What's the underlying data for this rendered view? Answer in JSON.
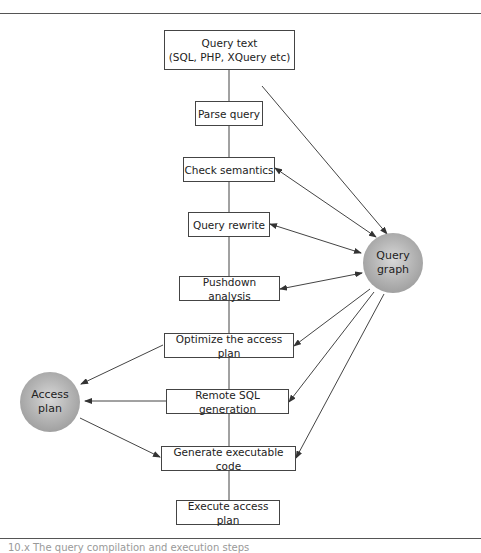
{
  "diagram": {
    "boxes": [
      {
        "id": "query-text",
        "label": "Query text\n(SQL, PHP, XQuery etc)",
        "line1": "Query text",
        "line2": "(SQL, PHP, XQuery etc)"
      },
      {
        "id": "parse-query",
        "label": "Parse query"
      },
      {
        "id": "check-semantics",
        "label": "Check semantics"
      },
      {
        "id": "query-rewrite",
        "label": "Query rewrite"
      },
      {
        "id": "pushdown-analysis",
        "label": "Pushdown analysis"
      },
      {
        "id": "optimize-access-plan",
        "label": "Optimize the access plan"
      },
      {
        "id": "remote-sql-generation",
        "label": "Remote SQL generation"
      },
      {
        "id": "generate-executable-code",
        "label": "Generate executable code"
      },
      {
        "id": "execute-access-plan",
        "label": "Execute access plan"
      }
    ],
    "nodes": [
      {
        "id": "query-graph",
        "line1": "Query",
        "line2": "graph"
      },
      {
        "id": "access-plan",
        "line1": "Access",
        "line2": "plan"
      }
    ],
    "edges": [
      {
        "from": "query-text",
        "to": "parse-query",
        "type": "line"
      },
      {
        "from": "parse-query",
        "to": "check-semantics",
        "type": "line"
      },
      {
        "from": "check-semantics",
        "to": "query-rewrite",
        "type": "line"
      },
      {
        "from": "query-rewrite",
        "to": "pushdown-analysis",
        "type": "line"
      },
      {
        "from": "pushdown-analysis",
        "to": "optimize-access-plan",
        "type": "line"
      },
      {
        "from": "optimize-access-plan",
        "to": "remote-sql-generation",
        "type": "line"
      },
      {
        "from": "remote-sql-generation",
        "to": "generate-executable-code",
        "type": "line"
      },
      {
        "from": "generate-executable-code",
        "to": "execute-access-plan",
        "type": "line"
      },
      {
        "from": "parse-query",
        "to": "query-graph",
        "type": "arrow"
      },
      {
        "from": "check-semantics",
        "to": "query-graph",
        "type": "bidirectional"
      },
      {
        "from": "query-rewrite",
        "to": "query-graph",
        "type": "bidirectional"
      },
      {
        "from": "pushdown-analysis",
        "to": "query-graph",
        "type": "bidirectional"
      },
      {
        "from": "query-graph",
        "to": "optimize-access-plan",
        "type": "arrow"
      },
      {
        "from": "query-graph",
        "to": "remote-sql-generation",
        "type": "arrow"
      },
      {
        "from": "query-graph",
        "to": "generate-executable-code",
        "type": "arrow"
      },
      {
        "from": "optimize-access-plan",
        "to": "access-plan",
        "type": "arrow"
      },
      {
        "from": "remote-sql-generation",
        "to": "access-plan",
        "type": "arrow"
      },
      {
        "from": "access-plan",
        "to": "generate-executable-code",
        "type": "arrow"
      }
    ],
    "caption": "10.x   The query compilation and execution steps"
  }
}
